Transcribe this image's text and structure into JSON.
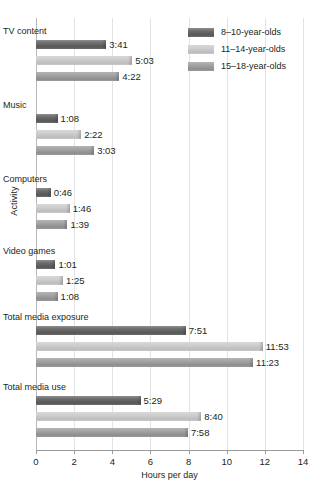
{
  "chart_data": {
    "type": "bar",
    "orientation": "horizontal",
    "title": "",
    "xlabel": "Hours per day",
    "ylabel": "Activity",
    "xlim": [
      0,
      14
    ],
    "xticks": [
      0,
      2,
      4,
      6,
      8,
      10,
      12,
      14
    ],
    "xticklabels": [
      "0",
      "2",
      "4",
      "6",
      "8",
      "10",
      "12",
      "14"
    ],
    "grid": "vertical",
    "legend_position": "top-right",
    "categories": [
      "TV content",
      "Music",
      "Computers",
      "Video games",
      "Total media exposure",
      "Total media use"
    ],
    "series": [
      {
        "name": "8–10-year-olds",
        "color": "#6f6f6f",
        "values": [
          3.683,
          1.133,
          0.767,
          1.017,
          7.85,
          5.483
        ],
        "labels": [
          "3:41",
          "1:08",
          "0:46",
          "1:01",
          "7:51",
          "5:29"
        ]
      },
      {
        "name": "11–14-year-olds",
        "color": "#cfcfcf",
        "values": [
          5.05,
          2.367,
          1.767,
          1.417,
          11.883,
          8.667
        ],
        "labels": [
          "5:03",
          "2:22",
          "1:46",
          "1:25",
          "11:53",
          "8:40"
        ]
      },
      {
        "name": "15–18-year-olds",
        "color": "#a4a4a4",
        "values": [
          4.367,
          3.05,
          1.65,
          1.133,
          11.383,
          7.967
        ],
        "labels": [
          "4:22",
          "3:03",
          "1:39",
          "1:08",
          "11:23",
          "7:58"
        ]
      }
    ]
  }
}
